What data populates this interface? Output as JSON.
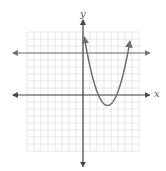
{
  "chart_data": {
    "type": "line",
    "title": "",
    "xlabel": "x",
    "ylabel": "y",
    "grid": true,
    "xlim": [
      -8,
      8
    ],
    "ylim": [
      -8,
      9
    ],
    "series": [
      {
        "name": "parabola",
        "kind": "quadratic",
        "vertex": [
          3.5,
          -1.5
        ],
        "intersections_with_line": [
          [
            0.6,
            6
          ],
          [
            6.3,
            6
          ]
        ],
        "x": [
          0.2,
          0.6,
          1,
          1.5,
          2,
          2.5,
          3,
          3.5,
          4,
          4.5,
          5,
          5.5,
          6,
          6.3,
          6.7
        ],
        "y": [
          8.3,
          6.0,
          4.2,
          2.3,
          0.9,
          -0.2,
          -1.2,
          -1.5,
          -1.2,
          -0.2,
          0.9,
          2.3,
          4.2,
          6.0,
          8.3
        ]
      },
      {
        "name": "horizontal line",
        "kind": "linear",
        "equation": "y = 6",
        "x": [
          -8.5,
          8.5
        ],
        "y": [
          6,
          6
        ]
      }
    ],
    "axes_arrows": true
  },
  "labels": {
    "x_axis": "x",
    "y_axis": "y"
  },
  "colors": {
    "grid": "#dcdcdc",
    "axes": "#444444",
    "curve": "#6e6e6e",
    "line": "#6e6e6e"
  }
}
